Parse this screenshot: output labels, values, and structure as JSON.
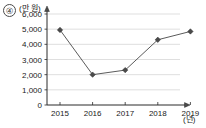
{
  "item_number": "④",
  "chart_data": {
    "type": "line",
    "title": "",
    "xlabel": "(년)",
    "ylabel": "(만 원)",
    "categories": [
      "2015",
      "2016",
      "2017",
      "2018",
      "2019"
    ],
    "values": [
      4950,
      2000,
      2300,
      4300,
      4850
    ],
    "series": [
      {
        "name": "",
        "values": [
          4950,
          2000,
          2300,
          4300,
          4850
        ]
      }
    ],
    "ylim": [
      0,
      6000
    ],
    "ytick_labels": [
      "0",
      "1,000",
      "2,000",
      "3,000",
      "4,000",
      "5,000",
      "6,000"
    ],
    "ytick_values": [
      0,
      1000,
      2000,
      3000,
      4000,
      5000,
      6000
    ],
    "xtick_labels": [
      "2015",
      "2016",
      "2017",
      "2018",
      "2019"
    ],
    "grid": true,
    "grid_axis": "y",
    "legend": false,
    "legend_position": "none",
    "marker": "diamond",
    "colors": {
      "line": "#5b5b5b",
      "marker": "#4a4a4a",
      "grid": "#c9c9c9",
      "axis": "#2b2b2b",
      "background": "#ffffff"
    }
  }
}
